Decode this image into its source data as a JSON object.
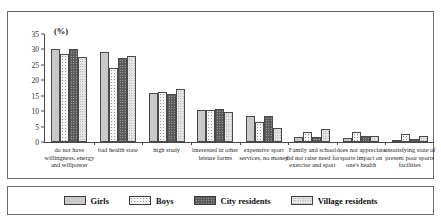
{
  "top_partial_text": "",
  "chart": {
    "unit_label": "(%)",
    "y_ticks": [
      "0",
      "5",
      "10",
      "15",
      "20",
      "25",
      "30",
      "35"
    ],
    "legend": [
      {
        "label": "Girls",
        "swatch": "solid-light-gray"
      },
      {
        "label": "Boys",
        "swatch": "white-dotted"
      },
      {
        "label": "City residents",
        "swatch": "dark-gray"
      },
      {
        "label": "Village residents",
        "swatch": "light-dotted"
      }
    ]
  },
  "chart_data": {
    "type": "bar",
    "title": "",
    "xlabel": "",
    "ylabel": "(%)",
    "ylim": [
      0,
      35
    ],
    "yticks": [
      0,
      5,
      10,
      15,
      20,
      25,
      30,
      35
    ],
    "grid": false,
    "legend_position": "bottom",
    "categories": [
      "do not have willingness, energy and willpower",
      "bad health state",
      "high study",
      "interested in other leisure forms",
      "expensive sport services, no money",
      "Family and school did not raise need for exercise and sport",
      "does not appreciate sports impact on one's health",
      "unsatisfying state of present poor sports facilities"
    ],
    "series": [
      {
        "name": "Girls",
        "values": [
          30.0,
          29.3,
          16.0,
          10.3,
          8.5,
          1.7,
          1.2,
          0.5
        ]
      },
      {
        "name": "Boys",
        "values": [
          28.5,
          24.0,
          16.2,
          10.5,
          6.5,
          3.2,
          3.2,
          2.7
        ]
      },
      {
        "name": "City residents",
        "values": [
          30.1,
          27.3,
          15.4,
          10.6,
          8.5,
          1.6,
          1.9,
          1.0
        ]
      },
      {
        "name": "Village residents",
        "values": [
          27.7,
          27.8,
          17.3,
          9.7,
          4.5,
          4.3,
          1.8,
          1.8
        ]
      }
    ]
  }
}
